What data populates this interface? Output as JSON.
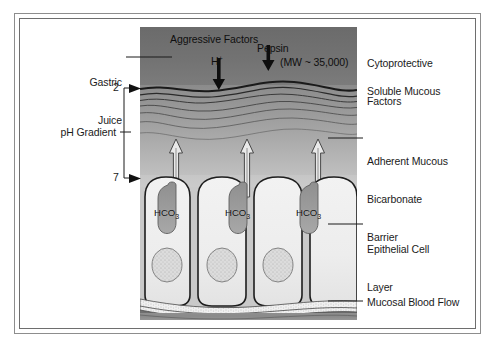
{
  "figure": {
    "title_implicit": "Gastric mucosal defense: aggressive versus cytoprotective factors",
    "panel_left_label_header": "Aggressive Factors",
    "panel_right_label_header": "Cytoprotective Factors"
  },
  "labels": {
    "aggressive_factors": "Aggressive Factors",
    "h_ion": "H",
    "h_ion_charge": "+",
    "pepsin": "Pepsin",
    "pepsin_mw": "(MW ~ 35,000)",
    "gastric_juice_line1": "Gastric",
    "gastric_juice_line2": "Juice",
    "ph_gradient": "pH Gradient",
    "ph_top_value": "2",
    "ph_bottom_value": "7",
    "cytoprotective_line1": "Cytoprotective",
    "cytoprotective_line2": "Factors",
    "soluble_mucous": "Soluble Mucous",
    "adherent_line1": "Adherent Mucous",
    "adherent_line2": "Bicarbonate",
    "adherent_line3": "Barrier",
    "epithelial_line1": "Epithelial Cell",
    "epithelial_line2": "Layer",
    "mucosal_blood_flow": "Mucosal Blood Flow",
    "bicarbonate_ion": "HCO",
    "bicarbonate_sub": "3"
  },
  "cells": [
    {
      "id": "epithelial-cell-1",
      "bicarbonate": "HCO",
      "subscript": "3"
    },
    {
      "id": "epithelial-cell-2",
      "bicarbonate": "HCO",
      "subscript": "3"
    },
    {
      "id": "epithelial-cell-3",
      "bicarbonate": "HCO",
      "subscript": "3"
    }
  ],
  "arrows": {
    "aggressive_down": [
      "H+",
      "Pepsin"
    ],
    "cytoprotective_up": [
      "HCO3",
      "HCO3",
      "HCO3"
    ]
  },
  "colors": {
    "frame_outer": "#8d8d8d",
    "frame_inner": "#6e6e6e",
    "text": "#1b1b1b",
    "panel_top_gray": "#6f6f6f",
    "panel_mid_gray": "#a6a6a6",
    "panel_light_gray": "#cfcfcf",
    "cell_fill": "#ededed",
    "vesicle_fill": "#9a9a9a",
    "nucleus_fill": "#d8d8d8",
    "blood_flow_gray": "#8a8a8a",
    "page_background": "#ffffff"
  }
}
